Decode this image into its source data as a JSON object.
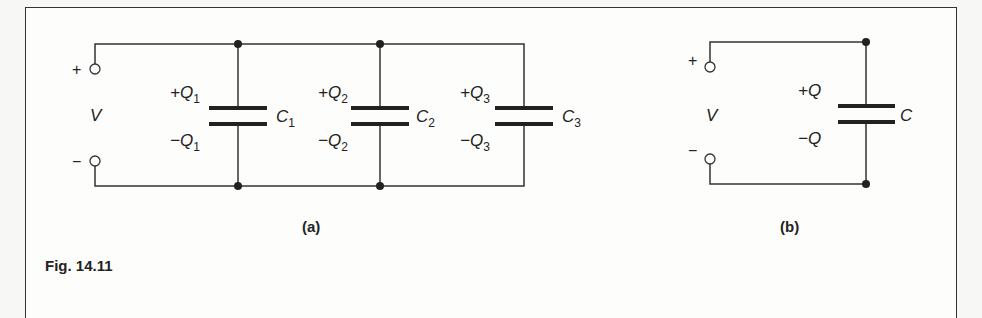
{
  "figure": {
    "caption": "Fig. 14.11",
    "panels": {
      "a": {
        "label": "(a)",
        "source": {
          "plus": "+",
          "minus": "−",
          "voltage": "V"
        },
        "capacitors": [
          {
            "name": "C",
            "sub": "1",
            "plus_charge": "+Q",
            "minus_charge": "−Q",
            "charge_sub": "1"
          },
          {
            "name": "C",
            "sub": "2",
            "plus_charge": "+Q",
            "minus_charge": "−Q",
            "charge_sub": "2"
          },
          {
            "name": "C",
            "sub": "3",
            "plus_charge": "+Q",
            "minus_charge": "−Q",
            "charge_sub": "3"
          }
        ]
      },
      "b": {
        "label": "(b)",
        "source": {
          "plus": "+",
          "minus": "−",
          "voltage": "V"
        },
        "capacitor": {
          "name": "C",
          "plus_charge": "+Q",
          "minus_charge": "−Q"
        }
      }
    }
  },
  "colors": {
    "ink": "#222222",
    "paper": "#fdfdfc"
  }
}
